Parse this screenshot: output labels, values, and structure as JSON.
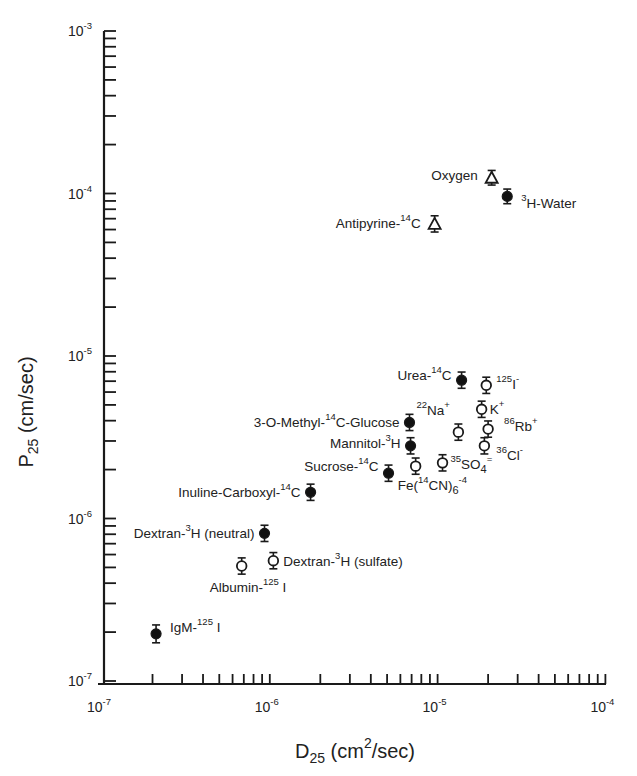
{
  "chart_data": {
    "type": "scatter",
    "title": "",
    "xlabel": "D25 (cm2/sec)",
    "xlabel_parts": {
      "main": "D",
      "sub": "25",
      "rest1": " (cm",
      "sup": "2",
      "rest2": "/sec)"
    },
    "ylabel": "P25 (cm/sec)",
    "ylabel_parts": {
      "main": "P",
      "sub": "25",
      "rest": " (cm/sec)"
    },
    "xscale": "log",
    "yscale": "log",
    "xlim": [
      1e-07,
      0.0001
    ],
    "ylim": [
      1e-07,
      0.001
    ],
    "x_ticks": [
      {
        "value": 1e-07,
        "base": "10",
        "exp": "-7"
      },
      {
        "value": 1e-06,
        "base": "10",
        "exp": "-6"
      },
      {
        "value": 1e-05,
        "base": "10",
        "exp": "-5"
      },
      {
        "value": 0.0001,
        "base": "10",
        "exp": "-4"
      }
    ],
    "y_ticks": [
      {
        "value": 1e-07,
        "base": "10",
        "exp": "-7"
      },
      {
        "value": 1e-06,
        "base": "10",
        "exp": "-6"
      },
      {
        "value": 1e-05,
        "base": "10",
        "exp": "-5"
      },
      {
        "value": 0.0001,
        "base": "10",
        "exp": "-4"
      },
      {
        "value": 0.001,
        "base": "10",
        "exp": "-3"
      }
    ],
    "grid": false,
    "legend": null,
    "marker_types": {
      "filled": "filled circle",
      "open": "open circle",
      "triangle": "open triangle"
    },
    "points": [
      {
        "label": "IgM-125 I",
        "x": 2.1e-07,
        "y": 1.95e-07,
        "marker": "filled",
        "err": 0.055,
        "parts": [
          [
            "IgM-",
            ""
          ],
          [
            "125",
            "sup"
          ],
          [
            " I",
            ""
          ]
        ],
        "lx": 14,
        "ly": -2,
        "anchor": "start"
      },
      {
        "label": "Albumin-125 I",
        "x": 6.8e-07,
        "y": 5.1e-07,
        "marker": "open",
        "err": 0.05,
        "parts": [
          [
            "Albumin-",
            ""
          ],
          [
            "125",
            "sup"
          ],
          [
            " I",
            ""
          ]
        ],
        "lx": -4,
        "ly": 26,
        "anchor": "start",
        "loff": -28
      },
      {
        "label": "Dextran-3H (neutral)",
        "x": 9.3e-07,
        "y": 8.1e-07,
        "marker": "filled",
        "err": 0.05,
        "parts": [
          [
            "Dextran-",
            ""
          ],
          [
            "3",
            "sup"
          ],
          [
            "H (neutral)",
            ""
          ]
        ],
        "lx": -10,
        "ly": 5,
        "anchor": "end"
      },
      {
        "label": "Dextran-3H (sulfate)",
        "x": 1.05e-06,
        "y": 5.5e-07,
        "marker": "open",
        "err": 0.05,
        "parts": [
          [
            "Dextran-",
            ""
          ],
          [
            "3",
            "sup"
          ],
          [
            "H (sulfate)",
            ""
          ]
        ],
        "lx": 10,
        "ly": 5,
        "anchor": "start"
      },
      {
        "label": "Inuline-Carboxyl-14C",
        "x": 1.75e-06,
        "y": 1.45e-06,
        "marker": "filled",
        "err": 0.05,
        "parts": [
          [
            "Inuline-Carboxyl-",
            ""
          ],
          [
            "14",
            "sup"
          ],
          [
            "C",
            ""
          ]
        ],
        "lx": -10,
        "ly": 5,
        "anchor": "end"
      },
      {
        "label": "Sucrose-14C",
        "x": 5.1e-06,
        "y": 1.9e-06,
        "marker": "filled",
        "err": 0.05,
        "parts": [
          [
            "Sucrose-",
            ""
          ],
          [
            "14",
            "sup"
          ],
          [
            "C",
            ""
          ]
        ],
        "lx": -10,
        "ly": -2,
        "anchor": "end"
      },
      {
        "label": "3-O-Methyl-14C-Glucose",
        "x": 6.8e-06,
        "y": 3.9e-06,
        "marker": "filled",
        "err": 0.05,
        "parts": [
          [
            "3-O-Methyl-",
            ""
          ],
          [
            "14",
            "sup"
          ],
          [
            "C-Glucose",
            ""
          ]
        ],
        "lx": -10,
        "ly": 5,
        "anchor": "end"
      },
      {
        "label": "Mannitol-3H",
        "x": 6.9e-06,
        "y": 2.8e-06,
        "marker": "filled",
        "err": 0.05,
        "parts": [
          [
            "Mannitol-",
            ""
          ],
          [
            "3",
            "sup"
          ],
          [
            "H",
            ""
          ]
        ],
        "lx": -10,
        "ly": 2,
        "anchor": "end"
      },
      {
        "label": "Fe(14CN)6-4",
        "x": 7.4e-06,
        "y": 2.1e-06,
        "marker": "open",
        "err": 0.05,
        "parts": [
          [
            "Fe(",
            ""
          ],
          [
            "14",
            "sup"
          ],
          [
            "CN)",
            ""
          ],
          [
            "6",
            "sub"
          ],
          [
            "-4",
            "sup"
          ]
        ],
        "lx": -18,
        "ly": 24,
        "anchor": "start"
      },
      {
        "label": "35SO4=",
        "x": 1.07e-05,
        "y": 2.2e-06,
        "marker": "open",
        "err": 0.05,
        "parts": [
          [
            "35",
            "sup"
          ],
          [
            "SO",
            ""
          ],
          [
            "4",
            "sub"
          ],
          [
            "=",
            "sup"
          ]
        ],
        "lx": 8,
        "ly": 6,
        "anchor": "start"
      },
      {
        "label": "22Na+",
        "x": 1.33e-05,
        "y": 3.4e-06,
        "marker": "open",
        "err": 0.05,
        "parts": [
          [
            "22",
            "sup"
          ],
          [
            "Na",
            ""
          ],
          [
            "+",
            "sup"
          ]
        ],
        "lx": -42,
        "ly": -17,
        "anchor": "start"
      },
      {
        "label": "Urea-14C",
        "x": 1.39e-05,
        "y": 7.1e-06,
        "marker": "filled",
        "err": 0.05,
        "parts": [
          [
            "Urea-",
            ""
          ],
          [
            "14",
            "sup"
          ],
          [
            "C",
            ""
          ]
        ],
        "lx": -10,
        "ly": 0,
        "anchor": "end"
      },
      {
        "label": "K+",
        "x": 1.83e-05,
        "y": 4.7e-06,
        "marker": "open",
        "err": 0.05,
        "parts": [
          [
            "K",
            ""
          ],
          [
            "+",
            "sup"
          ]
        ],
        "lx": 8,
        "ly": 5,
        "anchor": "start"
      },
      {
        "label": "36Cl-",
        "x": 1.9e-05,
        "y": 2.8e-06,
        "marker": "open",
        "err": 0.05,
        "parts": [
          [
            "36",
            "sup"
          ],
          [
            "Cl",
            ""
          ],
          [
            "-",
            "sup"
          ]
        ],
        "lx": 12,
        "ly": 14,
        "anchor": "start"
      },
      {
        "label": "125I-",
        "x": 1.95e-05,
        "y": 6.6e-06,
        "marker": "open",
        "err": 0.05,
        "parts": [
          [
            "125",
            "sup"
          ],
          [
            "I",
            ""
          ],
          [
            "-",
            "sup"
          ]
        ],
        "lx": 10,
        "ly": 4,
        "anchor": "start"
      },
      {
        "label": "86Rb+",
        "x": 2e-05,
        "y": 3.55e-06,
        "marker": "open",
        "err": 0.05,
        "parts": [
          [
            "86",
            "sup"
          ],
          [
            "Rb",
            ""
          ],
          [
            "+",
            "sup"
          ]
        ],
        "lx": 16,
        "ly": 2,
        "anchor": "start"
      },
      {
        "label": "Antipyrine-14C",
        "x": 9.6e-06,
        "y": 6.5e-05,
        "marker": "triangle",
        "err": 0.05,
        "parts": [
          [
            "Antipyrine-",
            ""
          ],
          [
            "14",
            "sup"
          ],
          [
            "C",
            ""
          ]
        ],
        "lx": -14,
        "ly": 4,
        "anchor": "end"
      },
      {
        "label": "Oxygen",
        "x": 2.1e-05,
        "y": 0.000125,
        "marker": "triangle",
        "err": 0.045,
        "parts": [
          [
            "Oxygen",
            ""
          ]
        ],
        "lx": -14,
        "ly": 2,
        "anchor": "end"
      },
      {
        "label": "3H-Water",
        "x": 2.6e-05,
        "y": 9.6e-05,
        "marker": "filled",
        "err": 0.045,
        "parts": [
          [
            "3",
            "sup"
          ],
          [
            "H-Water",
            ""
          ]
        ],
        "lx": 14,
        "ly": 12,
        "anchor": "start"
      }
    ]
  },
  "colors": {
    "ink": "#1a1a1a",
    "background": "#ffffff",
    "marker_fill": "#111111"
  }
}
